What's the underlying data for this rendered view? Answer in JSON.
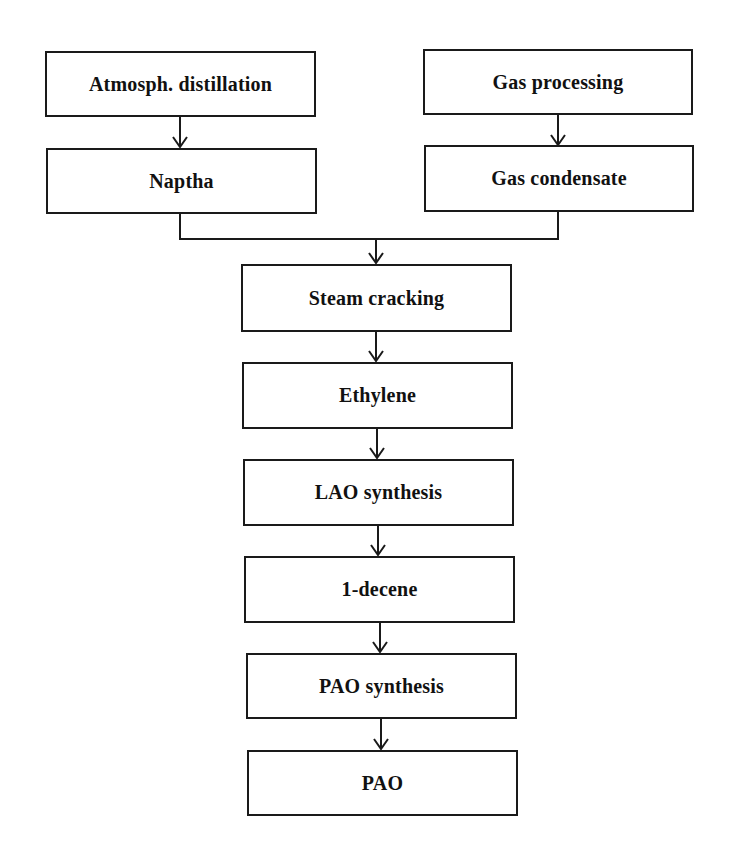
{
  "diagram": {
    "type": "flowchart",
    "colors": {
      "line": "#1a1a1a",
      "background": "#ffffff",
      "text": "#111111"
    },
    "nodes": [
      {
        "id": "atmos",
        "label": "Atmosph. distillation"
      },
      {
        "id": "gasproc",
        "label": "Gas processing"
      },
      {
        "id": "naptha",
        "label": "Naptha"
      },
      {
        "id": "gascond",
        "label": "Gas condensate"
      },
      {
        "id": "steam",
        "label": "Steam cracking"
      },
      {
        "id": "ethylene",
        "label": "Ethylene"
      },
      {
        "id": "lao",
        "label": "LAO synthesis"
      },
      {
        "id": "decene",
        "label": "1-decene"
      },
      {
        "id": "paosynth",
        "label": "PAO synthesis"
      },
      {
        "id": "pao",
        "label": "PAO"
      }
    ],
    "edges": [
      {
        "from": "atmos",
        "to": "naptha"
      },
      {
        "from": "gasproc",
        "to": "gascond"
      },
      {
        "from": "naptha",
        "to": "steam"
      },
      {
        "from": "gascond",
        "to": "steam"
      },
      {
        "from": "steam",
        "to": "ethylene"
      },
      {
        "from": "ethylene",
        "to": "lao"
      },
      {
        "from": "lao",
        "to": "decene"
      },
      {
        "from": "decene",
        "to": "paosynth"
      },
      {
        "from": "paosynth",
        "to": "pao"
      }
    ]
  }
}
